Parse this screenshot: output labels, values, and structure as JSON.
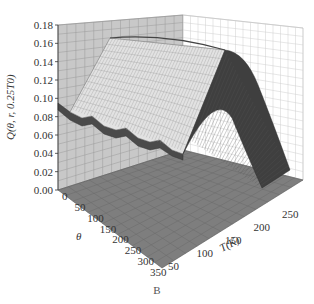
{
  "figure": {
    "panel_label": "B",
    "caption_fragment": ""
  },
  "chart_data": {
    "type": "surface3d",
    "title": "",
    "zlabel": "Q(θ, r, 0.25T0)",
    "xlabel": "θ",
    "ylabel": "T(K)",
    "zlim": [
      0.0,
      0.18
    ],
    "z_ticks": [
      "0.00",
      "0.02",
      "0.04",
      "0.06",
      "0.08",
      "0.10",
      "0.12",
      "0.14",
      "0.16",
      "0.18"
    ],
    "theta_ticks": [
      "0",
      "50",
      "100",
      "150",
      "200",
      "250",
      "300",
      "350"
    ],
    "T_ticks": [
      "50",
      "100",
      "150",
      "200",
      "250"
    ],
    "theta_range": [
      0,
      350
    ],
    "T_range": [
      50,
      280
    ],
    "grid": true,
    "series": [
      {
        "name": "ridge_max_along_theta",
        "theta": [
          0,
          50,
          100,
          150,
          200,
          250,
          300,
          350
        ],
        "values": [
          0.1,
          0.165,
          0.165,
          0.165,
          0.165,
          0.165,
          0.165,
          0.165
        ]
      },
      {
        "name": "profile_vs_T_at_theta_350",
        "T": [
          50,
          100,
          150,
          180,
          200,
          230,
          250,
          280
        ],
        "values": [
          0.0,
          0.0,
          0.08,
          0.165,
          0.16,
          0.1,
          0.05,
          0.0
        ]
      },
      {
        "name": "edge_at_low_T",
        "theta": [
          0,
          50,
          100,
          150,
          200,
          250,
          300,
          350
        ],
        "values": [
          0.1,
          0.085,
          0.08,
          0.07,
          0.065,
          0.055,
          0.05,
          0.04
        ]
      }
    ]
  }
}
